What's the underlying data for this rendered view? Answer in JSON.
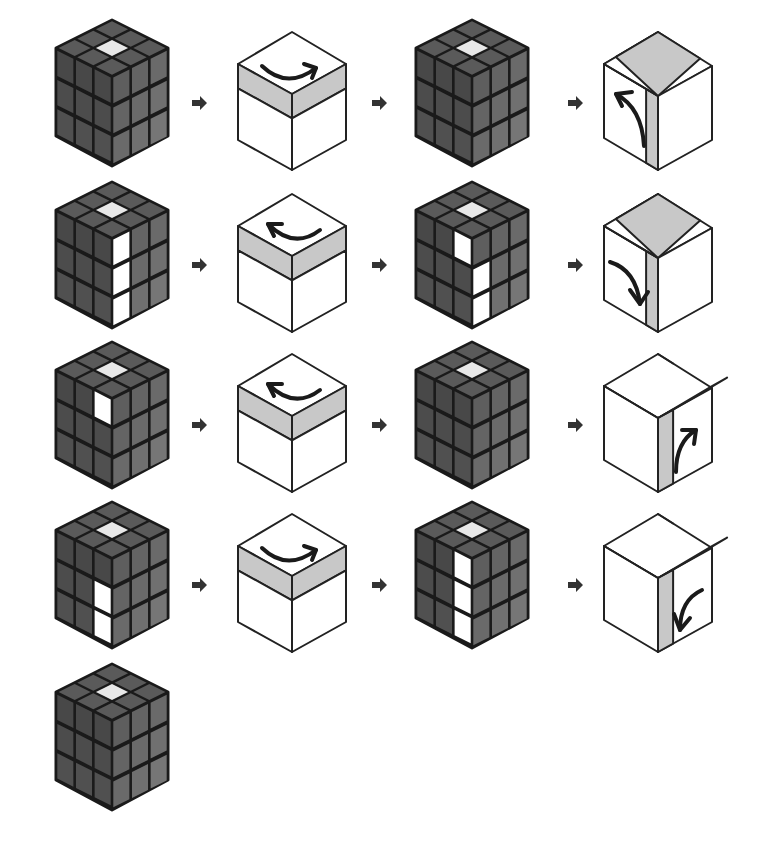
{
  "diagram": {
    "title": "",
    "colors": {
      "background": "#ffffff",
      "cube_outline": "#1a1a1a",
      "sticker_top": "#5a5a5a",
      "sticker_left": "#4e4e4e",
      "sticker_right": "#6b6b6b",
      "sticker_white": "#ffffff",
      "sticker_center_top": "#e8e8e8",
      "rotation_band": "#c8c8c8",
      "step_arrow": "#333333"
    },
    "rows": [
      {
        "y": 18,
        "steps": [
          {
            "kind": "cube",
            "x": 52,
            "highlights": {
              "top": [
                4
              ],
              "left": [],
              "right": []
            }
          },
          {
            "kind": "arrow",
            "x": 192
          },
          {
            "kind": "move",
            "x": 232,
            "band": "top",
            "direction": "clockwise",
            "arrow_label": "top-right-turn"
          },
          {
            "kind": "arrow",
            "x": 372
          },
          {
            "kind": "cube",
            "x": 412,
            "highlights": {
              "top": [
                4
              ],
              "left": [],
              "right": []
            }
          },
          {
            "kind": "arrow",
            "x": 568
          },
          {
            "kind": "move",
            "x": 592,
            "band": "left-front-column",
            "direction": "up",
            "arrow_label": "front-up-turn"
          }
        ]
      },
      {
        "y": 180,
        "steps": [
          {
            "kind": "cube",
            "x": 52,
            "highlights": {
              "top": [
                4
              ],
              "left": [],
              "right": [
                0,
                3,
                6
              ]
            }
          },
          {
            "kind": "arrow",
            "x": 192
          },
          {
            "kind": "move",
            "x": 232,
            "band": "top",
            "direction": "counterclockwise",
            "arrow_label": "top-left-turn"
          },
          {
            "kind": "arrow",
            "x": 372
          },
          {
            "kind": "cube",
            "x": 412,
            "highlights": {
              "top": [
                4
              ],
              "left": [
                2
              ],
              "right": [
                3,
                6
              ]
            }
          },
          {
            "kind": "arrow",
            "x": 568
          },
          {
            "kind": "move",
            "x": 592,
            "band": "left-front-column",
            "direction": "down",
            "arrow_label": "front-down-turn"
          }
        ]
      },
      {
        "y": 340,
        "steps": [
          {
            "kind": "cube",
            "x": 52,
            "highlights": {
              "top": [
                4
              ],
              "left": [
                2
              ],
              "right": []
            }
          },
          {
            "kind": "arrow",
            "x": 192
          },
          {
            "kind": "move",
            "x": 232,
            "band": "top",
            "direction": "counterclockwise",
            "arrow_label": "top-left-turn"
          },
          {
            "kind": "arrow",
            "x": 372
          },
          {
            "kind": "cube",
            "x": 412,
            "highlights": {
              "top": [
                4
              ],
              "left": [],
              "right": []
            }
          },
          {
            "kind": "arrow",
            "x": 568
          },
          {
            "kind": "move",
            "x": 592,
            "band": "right-front-column",
            "direction": "up",
            "arrow_label": "right-up-turn"
          }
        ]
      },
      {
        "y": 500,
        "steps": [
          {
            "kind": "cube",
            "x": 52,
            "highlights": {
              "top": [
                4
              ],
              "left": [
                5,
                8
              ],
              "right": []
            }
          },
          {
            "kind": "arrow",
            "x": 192
          },
          {
            "kind": "move",
            "x": 232,
            "band": "top",
            "direction": "clockwise",
            "arrow_label": "top-right-turn"
          },
          {
            "kind": "arrow",
            "x": 372
          },
          {
            "kind": "cube",
            "x": 412,
            "highlights": {
              "top": [
                4
              ],
              "left": [
                2,
                5,
                8
              ],
              "right": []
            }
          },
          {
            "kind": "arrow",
            "x": 568
          },
          {
            "kind": "move",
            "x": 592,
            "band": "right-front-column",
            "direction": "down",
            "arrow_label": "right-down-turn"
          }
        ]
      },
      {
        "y": 662,
        "steps": [
          {
            "kind": "cube",
            "x": 52,
            "highlights": {
              "top": [
                4
              ],
              "left": [],
              "right": []
            }
          }
        ]
      }
    ]
  }
}
